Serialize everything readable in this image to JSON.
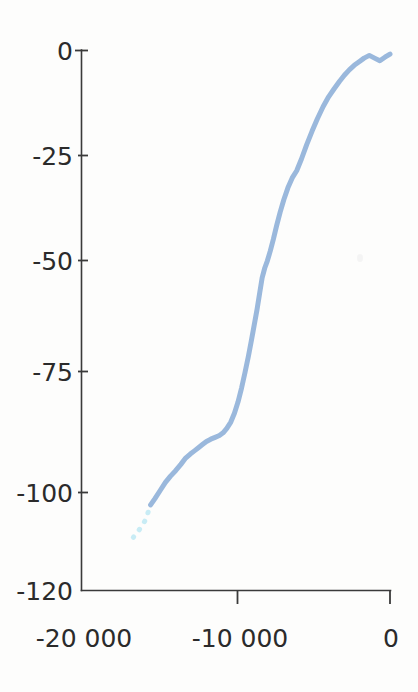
{
  "figure": {
    "background_color": "#fdfdfc",
    "axis_color": "#3a3a3a",
    "label_color": "#2b2b2b"
  },
  "chart_data": {
    "type": "line",
    "title": "",
    "subtitle": "",
    "xlabel": "",
    "ylabel": "",
    "xlim": [
      -20000,
      0
    ],
    "ylim": [
      -120,
      0
    ],
    "grid": false,
    "legend": null,
    "x_tick_labels": [
      "-20 000",
      "-10 000",
      "0"
    ],
    "x_tick_values": [
      -20000,
      -10000,
      0
    ],
    "y_tick_labels": [
      "0",
      "-25",
      "-50",
      "-75",
      "-100",
      "-120"
    ],
    "y_tick_values": [
      0,
      -25,
      -50,
      -75,
      -100,
      -120
    ],
    "series": [
      {
        "name": "sea-level-curve-solid",
        "style": "solid",
        "color": "#9ab8dc",
        "line_width": 5,
        "x": [
          -15520,
          -15240,
          -14900,
          -14560,
          -14230,
          -13900,
          -13560,
          -13250,
          -12950,
          -12680,
          -12420,
          -12160,
          -11900,
          -11620,
          -11340,
          -11060,
          -10820,
          -10580,
          -10320,
          -10080,
          -9850,
          -9620,
          -9400,
          -9180,
          -8980,
          -8800,
          -8620,
          -8450,
          -8290,
          -8120,
          -7950,
          -7760,
          -7560,
          -7350,
          -7120,
          -6880,
          -6620,
          -6340,
          -6050,
          -5740,
          -5400,
          -5050,
          -4700,
          -4340,
          -3980,
          -3620,
          -3280,
          -2960,
          -2640,
          -2320,
          -2000,
          -1680,
          -1340,
          -1000,
          -660,
          -330,
          0
        ],
        "y": [
          -101.0,
          -99.6,
          -97.8,
          -96.0,
          -94.6,
          -93.4,
          -92.0,
          -90.6,
          -89.7,
          -89.0,
          -88.3,
          -87.6,
          -86.9,
          -86.4,
          -86.0,
          -85.6,
          -85.0,
          -84.0,
          -82.6,
          -80.6,
          -78.1,
          -75.0,
          -71.6,
          -68.0,
          -64.4,
          -61.0,
          -57.6,
          -54.0,
          -50.6,
          -48.4,
          -46.8,
          -44.6,
          -42.0,
          -39.0,
          -36.0,
          -33.2,
          -30.6,
          -28.4,
          -26.8,
          -24.2,
          -21.0,
          -18.0,
          -15.2,
          -12.6,
          -10.4,
          -8.6,
          -7.0,
          -5.6,
          -4.4,
          -3.4,
          -2.6,
          -1.8,
          -1.2,
          -1.8,
          -2.4,
          -1.6,
          -0.9
        ]
      },
      {
        "name": "sea-level-curve-dotted-extension",
        "style": "dotted",
        "color": "#c8ecf5",
        "line_width": 5,
        "x": [
          -16640,
          -16400,
          -16150,
          -15900,
          -15700,
          -15520
        ],
        "y": [
          -108.2,
          -107.2,
          -106.0,
          -104.6,
          -102.8,
          -101.0
        ]
      }
    ],
    "annotations": []
  }
}
